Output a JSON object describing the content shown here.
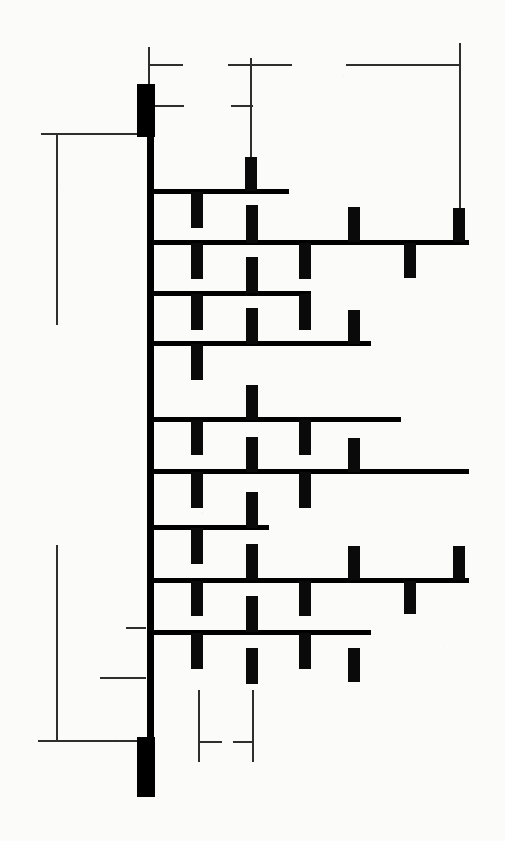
{
  "document": {
    "kind": "architectural-floor-plan",
    "title": "Floor Plan — Spine Wall with Pier Bays",
    "sheet_size": {
      "width": 505,
      "height": 841
    },
    "background_color": "#fbfbf9",
    "ink_color": "#000000",
    "dimension_line_color": "#2e2e2e"
  },
  "legend": {
    "spine_wall_label": "",
    "pier_label": "",
    "dimension_label": ""
  },
  "geometry": {
    "spine_wall": {
      "x": 147,
      "y": 135,
      "width": 6,
      "height": 606
    },
    "end_blocks": [
      {
        "name": "north-terminal-block",
        "x": 137,
        "y": 84,
        "width": 17,
        "height": 52
      },
      {
        "name": "south-terminal-block",
        "x": 137,
        "y": 737,
        "width": 17,
        "height": 59
      }
    ],
    "cross_walls": [
      {
        "id": "w01",
        "y": 189,
        "x1": 150,
        "x2": 288,
        "thickness": 4
      },
      {
        "id": "w02",
        "y": 240,
        "x1": 150,
        "x2": 468,
        "thickness": 4
      },
      {
        "id": "w03",
        "y": 291,
        "x1": 150,
        "x2": 310,
        "thickness": 4
      },
      {
        "id": "w04",
        "y": 341,
        "x1": 150,
        "x2": 370,
        "thickness": 4
      },
      {
        "id": "w05",
        "y": 417,
        "x1": 150,
        "x2": 400,
        "thickness": 4
      },
      {
        "id": "w06",
        "y": 469,
        "x1": 150,
        "x2": 468,
        "thickness": 4
      },
      {
        "id": "w07",
        "y": 525,
        "x1": 150,
        "x2": 268,
        "thickness": 4
      },
      {
        "id": "w08",
        "y": 578,
        "x1": 150,
        "x2": 468,
        "thickness": 4
      },
      {
        "id": "w09",
        "y": 630,
        "x1": 150,
        "x2": 370,
        "thickness": 4
      }
    ],
    "piers": [
      {
        "id": "p01",
        "x": 245,
        "y": 157,
        "width": 12,
        "height": 34,
        "side": "above",
        "wall": "w01"
      },
      {
        "id": "p02",
        "x": 191,
        "y": 192,
        "width": 12,
        "height": 36,
        "side": "below",
        "wall": "w01"
      },
      {
        "id": "p03",
        "x": 246,
        "y": 205,
        "width": 12,
        "height": 38,
        "side": "above",
        "wall": "w02"
      },
      {
        "id": "p04",
        "x": 348,
        "y": 207,
        "width": 12,
        "height": 35,
        "side": "above",
        "wall": "w02"
      },
      {
        "id": "p05",
        "x": 453,
        "y": 208,
        "width": 12,
        "height": 34,
        "side": "above",
        "wall": "w02"
      },
      {
        "id": "p06",
        "x": 191,
        "y": 243,
        "width": 12,
        "height": 36,
        "side": "below",
        "wall": "w02"
      },
      {
        "id": "p07",
        "x": 299,
        "y": 243,
        "width": 12,
        "height": 36,
        "side": "below",
        "wall": "w02"
      },
      {
        "id": "p08",
        "x": 404,
        "y": 243,
        "width": 12,
        "height": 35,
        "side": "below",
        "wall": "w02"
      },
      {
        "id": "p09",
        "x": 246,
        "y": 257,
        "width": 12,
        "height": 36,
        "side": "above",
        "wall": "w03"
      },
      {
        "id": "p10",
        "x": 191,
        "y": 294,
        "width": 12,
        "height": 36,
        "side": "below",
        "wall": "w03"
      },
      {
        "id": "p11",
        "x": 299,
        "y": 294,
        "width": 12,
        "height": 36,
        "side": "below",
        "wall": "w03"
      },
      {
        "id": "p12",
        "x": 246,
        "y": 308,
        "width": 12,
        "height": 36,
        "side": "above",
        "wall": "w04"
      },
      {
        "id": "p13",
        "x": 348,
        "y": 310,
        "width": 12,
        "height": 34,
        "side": "above",
        "wall": "w04"
      },
      {
        "id": "p14",
        "x": 191,
        "y": 344,
        "width": 12,
        "height": 36,
        "side": "below",
        "wall": "w04"
      },
      {
        "id": "p15",
        "x": 246,
        "y": 385,
        "width": 12,
        "height": 35,
        "side": "above",
        "wall": "w05"
      },
      {
        "id": "p16",
        "x": 191,
        "y": 420,
        "width": 12,
        "height": 35,
        "side": "below",
        "wall": "w05"
      },
      {
        "id": "p17",
        "x": 299,
        "y": 420,
        "width": 12,
        "height": 35,
        "side": "below",
        "wall": "w05"
      },
      {
        "id": "p18",
        "x": 246,
        "y": 437,
        "width": 12,
        "height": 35,
        "side": "above",
        "wall": "w06"
      },
      {
        "id": "p19",
        "x": 348,
        "y": 438,
        "width": 12,
        "height": 34,
        "side": "above",
        "wall": "w06"
      },
      {
        "id": "p20",
        "x": 191,
        "y": 472,
        "width": 12,
        "height": 36,
        "side": "below",
        "wall": "w06"
      },
      {
        "id": "p21",
        "x": 299,
        "y": 472,
        "width": 12,
        "height": 36,
        "side": "below",
        "wall": "w06"
      },
      {
        "id": "p22",
        "x": 246,
        "y": 492,
        "width": 12,
        "height": 36,
        "side": "above",
        "wall": "w07"
      },
      {
        "id": "p23",
        "x": 191,
        "y": 528,
        "width": 12,
        "height": 36,
        "side": "below",
        "wall": "w07"
      },
      {
        "id": "p24",
        "x": 246,
        "y": 544,
        "width": 12,
        "height": 36,
        "side": "above",
        "wall": "w08"
      },
      {
        "id": "p25",
        "x": 348,
        "y": 546,
        "width": 12,
        "height": 34,
        "side": "above",
        "wall": "w08"
      },
      {
        "id": "p26",
        "x": 453,
        "y": 546,
        "width": 12,
        "height": 34,
        "side": "above",
        "wall": "w08"
      },
      {
        "id": "p27",
        "x": 191,
        "y": 581,
        "width": 12,
        "height": 35,
        "side": "below",
        "wall": "w08"
      },
      {
        "id": "p28",
        "x": 299,
        "y": 581,
        "width": 12,
        "height": 35,
        "side": "below",
        "wall": "w08"
      },
      {
        "id": "p29",
        "x": 404,
        "y": 581,
        "width": 12,
        "height": 33,
        "side": "below",
        "wall": "w08"
      },
      {
        "id": "p30",
        "x": 246,
        "y": 596,
        "width": 12,
        "height": 36,
        "side": "above",
        "wall": "w09"
      },
      {
        "id": "p31",
        "x": 191,
        "y": 633,
        "width": 12,
        "height": 36,
        "side": "below",
        "wall": "w09"
      },
      {
        "id": "p32",
        "x": 299,
        "y": 633,
        "width": 12,
        "height": 36,
        "side": "below",
        "wall": "w09"
      },
      {
        "id": "p33",
        "x": 348,
        "y": 648,
        "width": 12,
        "height": 34,
        "side": "above",
        "wall": "none"
      },
      {
        "id": "p34",
        "x": 246,
        "y": 648,
        "width": 12,
        "height": 36,
        "side": "free",
        "wall": "none"
      }
    ],
    "dimensions": {
      "left_upper": {
        "name": "left-upper-dimension",
        "extension_top_y": 134,
        "extension_x": 57,
        "extension_bottom_y": 325,
        "lead_x1": 41,
        "lead_x2": 147,
        "lead_y": 134,
        "value": ""
      },
      "left_lower": {
        "name": "left-lower-dimension",
        "extension_top_y": 545,
        "extension_x": 57,
        "extension_bottom_y": 741,
        "lead_x1": 38,
        "lead_x2": 147,
        "lead_y": 741,
        "value": ""
      },
      "top_left": {
        "name": "top-left-dimension",
        "extension_x": 149,
        "extension_top_y": 47,
        "extension_bottom_y": 90,
        "tick_a_y": 65,
        "tick_a_x1": 149,
        "tick_a_x2": 182,
        "tick_b_y": 106,
        "tick_b_x1": 153,
        "tick_b_x2": 183,
        "value": ""
      },
      "top_mid": {
        "name": "top-middle-dimension",
        "extension_x": 251,
        "extension_top_y": 57,
        "extension_bottom_y": 185,
        "tick_a_y": 65,
        "tick_a_x1": 228,
        "tick_a_x2": 292,
        "tick_b_y": 106,
        "tick_b_x1": 231,
        "tick_b_x2": 252,
        "value": ""
      },
      "top_right": {
        "name": "top-right-dimension",
        "lead_y": 65,
        "lead_x1": 346,
        "lead_x2": 461,
        "extension_x": 460,
        "extension_top_y": 43,
        "extension_bottom_y": 238,
        "value": ""
      },
      "mid_left_tick": {
        "name": "mid-left-tick",
        "y": 628,
        "x1": 126,
        "x2": 146,
        "value": ""
      },
      "mid_left_tick2": {
        "name": "mid-left-tick-2",
        "y": 678,
        "x1": 100,
        "x2": 146,
        "value": ""
      },
      "bottom": {
        "name": "bottom-dimension",
        "extension_a_x": 199,
        "extension_a_top_y": 690,
        "extension_a_bottom_y": 762,
        "extension_b_x": 253,
        "extension_b_top_y": 690,
        "extension_b_bottom_y": 762,
        "tick_y": 742,
        "tick_a_x1": 199,
        "tick_a_x2": 222,
        "tick_b_x1": 234,
        "tick_b_x2": 254,
        "value": ""
      }
    }
  }
}
